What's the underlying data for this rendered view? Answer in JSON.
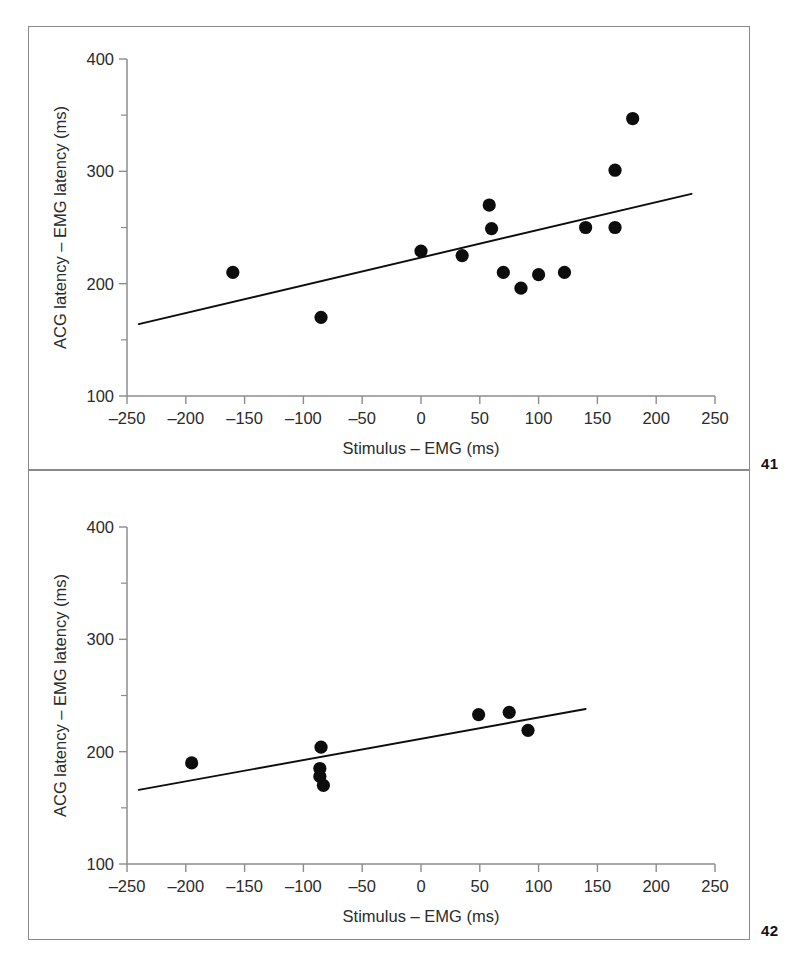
{
  "figure": {
    "background_color": "#ffffff",
    "frame_color": "#8a8a8a",
    "point_color": "#0d0d0d",
    "line_color": "#0d0d0d"
  },
  "panels": [
    {
      "number": "41",
      "chart_data": {
        "type": "scatter",
        "title": "",
        "xlabel": "Stimulus – EMG (ms)",
        "ylabel": "ACG latency – EMG latency (ms)",
        "xlim": [
          -250,
          250
        ],
        "ylim": [
          100,
          400
        ],
        "xticks": [
          -250,
          -200,
          -150,
          -100,
          -50,
          0,
          50,
          100,
          150,
          200,
          250
        ],
        "xticklabels": [
          "–250",
          "–200",
          "–150",
          "–100",
          "–50",
          "0",
          "50",
          "100",
          "150",
          "200",
          "250"
        ],
        "yticks": [
          100,
          200,
          300,
          400
        ],
        "yticklabels": [
          "100",
          "200",
          "300",
          "400"
        ],
        "yticks_minor": [
          150,
          250,
          350
        ],
        "grid": false,
        "legend": false,
        "points": [
          {
            "x": -160,
            "y": 210
          },
          {
            "x": -85,
            "y": 170
          },
          {
            "x": 0,
            "y": 229
          },
          {
            "x": 35,
            "y": 225
          },
          {
            "x": 58,
            "y": 270
          },
          {
            "x": 60,
            "y": 249
          },
          {
            "x": 70,
            "y": 210
          },
          {
            "x": 85,
            "y": 196
          },
          {
            "x": 100,
            "y": 208
          },
          {
            "x": 122,
            "y": 210
          },
          {
            "x": 140,
            "y": 250
          },
          {
            "x": 165,
            "y": 250
          },
          {
            "x": 165,
            "y": 301
          },
          {
            "x": 180,
            "y": 347
          }
        ],
        "fit_line": {
          "x0": -240,
          "y0": 164,
          "x1": 230,
          "y1": 280
        }
      }
    },
    {
      "number": "42",
      "chart_data": {
        "type": "scatter",
        "title": "",
        "xlabel": "Stimulus – EMG (ms)",
        "ylabel": "ACG latency – EMG latency (ms)",
        "xlim": [
          -250,
          250
        ],
        "ylim": [
          100,
          400
        ],
        "xticks": [
          -250,
          -200,
          -150,
          -100,
          -50,
          0,
          50,
          100,
          150,
          200,
          250
        ],
        "xticklabels": [
          "–250",
          "–200",
          "–150",
          "–100",
          "–50",
          "0",
          "50",
          "100",
          "150",
          "200",
          "250"
        ],
        "yticks": [
          100,
          200,
          300,
          400
        ],
        "yticklabels": [
          "100",
          "200",
          "300",
          "400"
        ],
        "yticks_minor": [
          150,
          250,
          350
        ],
        "grid": false,
        "legend": false,
        "points": [
          {
            "x": -195,
            "y": 190
          },
          {
            "x": -85,
            "y": 204
          },
          {
            "x": -86,
            "y": 185
          },
          {
            "x": -86,
            "y": 178
          },
          {
            "x": -83,
            "y": 170
          },
          {
            "x": 49,
            "y": 233
          },
          {
            "x": 75,
            "y": 235
          },
          {
            "x": 91,
            "y": 219
          }
        ],
        "fit_line": {
          "x0": -240,
          "y0": 166,
          "x1": 140,
          "y1": 238
        }
      }
    }
  ]
}
